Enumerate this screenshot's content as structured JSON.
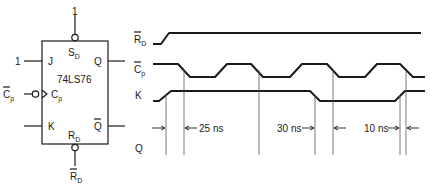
{
  "figure": {
    "chip": {
      "part_number": "74LS76",
      "pins": {
        "set": {
          "main": "S",
          "sub": "D"
        },
        "j": "J",
        "clock": {
          "main": "C",
          "sub": "p"
        },
        "k": "K",
        "reset": {
          "main": "R",
          "sub": "D"
        },
        "q": "Q",
        "q_bar": "Q"
      },
      "external": {
        "set_input": "1",
        "j_input": "1",
        "clock_input": {
          "main": "C",
          "sub": "p",
          "overbar": true
        },
        "reset_input": {
          "main": "R",
          "sub": "D",
          "overbar": true
        }
      }
    },
    "timing": {
      "signals": [
        {
          "id": "rd",
          "main": "R",
          "sub": "D",
          "overbar": true
        },
        {
          "id": "cp",
          "main": "C",
          "sub": "p",
          "overbar": true
        },
        {
          "id": "k",
          "main": "K",
          "sub": "",
          "overbar": false
        },
        {
          "id": "q",
          "main": "Q",
          "sub": "",
          "overbar": false
        }
      ],
      "delays": [
        {
          "label": "25 ns"
        },
        {
          "label": "30 ns"
        },
        {
          "label": "10 ns"
        }
      ]
    }
  }
}
